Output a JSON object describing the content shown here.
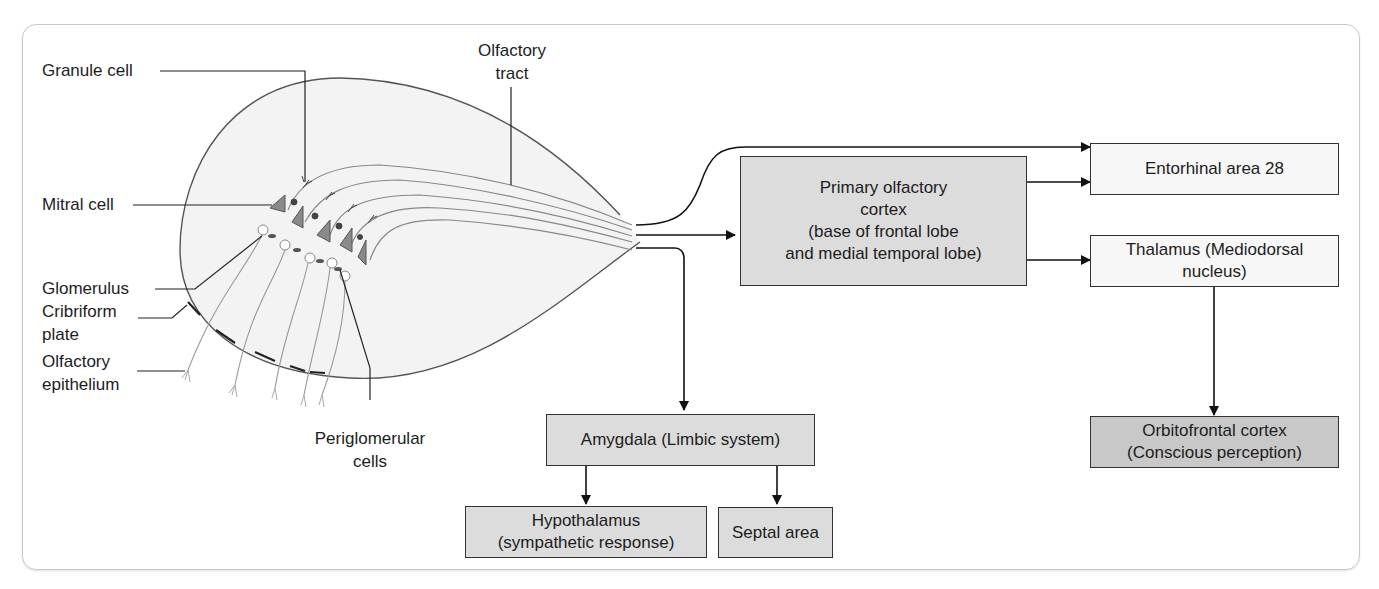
{
  "figure": {
    "bulb_labels": {
      "granule_cell": "Granule cell",
      "mitral_cell": "Mitral cell",
      "glomerulus": "Glomerulus",
      "cribriform_plate": [
        "Cribriform",
        "plate"
      ],
      "olfactory_epithelium": [
        "Olfactory",
        "epithelium"
      ],
      "periglomerular_cells": [
        "Periglomerular",
        "cells"
      ],
      "olfactory_tract": [
        "Olfactory",
        "tract"
      ]
    },
    "boxes": {
      "primary_cortex": [
        "Primary olfactory",
        "cortex",
        "(base of frontal lobe",
        "and medial temporal lobe)"
      ],
      "entorhinal": [
        "Entorhinal area 28"
      ],
      "thalamus": [
        "Thalamus (Mediodorsal",
        "nucleus)"
      ],
      "orbitofrontal": [
        "Orbitofrontal cortex",
        "(Conscious perception)"
      ],
      "amygdala": [
        "Amygdala (Limbic system)"
      ],
      "hypothalamus": [
        "Hypothalamus",
        "(sympathetic response)"
      ],
      "septal": [
        "Septal area"
      ]
    },
    "colors": {
      "box_gray": "#dcdcdc",
      "box_dark": "#c8c8c8",
      "box_light": "#f7f7f7",
      "mitral_fill": "#8a8a8a",
      "bulb_fill": "#f3f3f3",
      "frame_border": "#c9c9c9"
    }
  }
}
